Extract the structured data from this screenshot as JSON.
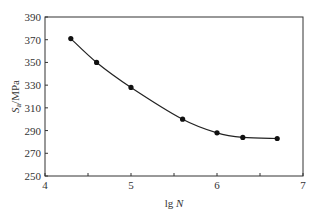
{
  "chart_data": {
    "type": "line",
    "title": "",
    "xlabel": "lg N",
    "ylabel": "Sa/MPa",
    "x": [
      4.3,
      4.6,
      5.0,
      5.6,
      6.0,
      6.3,
      6.7
    ],
    "values": [
      371,
      350,
      328,
      300,
      288,
      284,
      283
    ],
    "xlim": [
      4,
      7
    ],
    "ylim": [
      250,
      390
    ],
    "xticks": [
      "4",
      "5",
      "6",
      "7"
    ],
    "yticks": [
      "250",
      "270",
      "290",
      "310",
      "330",
      "350",
      "370",
      "390"
    ],
    "grid": false,
    "legend": false
  }
}
